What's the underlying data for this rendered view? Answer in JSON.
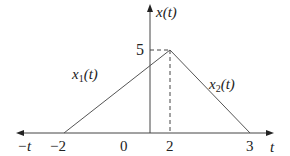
{
  "diagram": {
    "type": "piecewise-linear-signal",
    "axes": {
      "x_label": "t",
      "x_neg_label": "−t",
      "y_label": "x(t)"
    },
    "tick_labels": {
      "neg2": "−2",
      "zero": "0",
      "two": "2",
      "three": "3",
      "peak_value": "5"
    },
    "segments": [
      {
        "name": "x",
        "sub": "1",
        "arg": "(t)",
        "from": [
          -2,
          0
        ],
        "to": [
          2,
          5
        ]
      },
      {
        "name": "x",
        "sub": "2",
        "arg": "(t)",
        "from": [
          2,
          5
        ],
        "to": [
          3,
          0
        ]
      }
    ],
    "peak": {
      "t": 2,
      "value": 5
    },
    "colors": {
      "line": "#555555",
      "axis": "#444444",
      "text": "#222222"
    }
  }
}
